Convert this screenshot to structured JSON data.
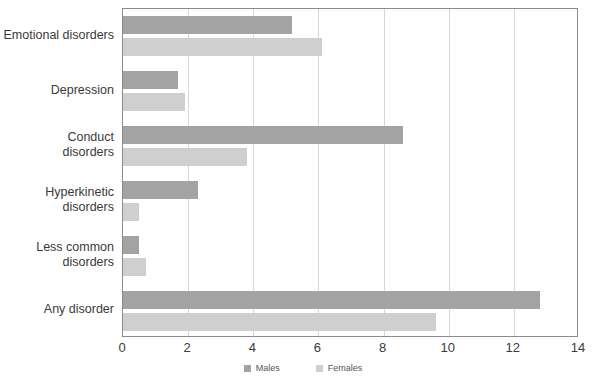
{
  "chart_data": {
    "type": "bar",
    "orientation": "horizontal",
    "title": "",
    "xlabel": "",
    "ylabel": "",
    "xlim": [
      0,
      14
    ],
    "xticks": [
      0,
      2,
      4,
      6,
      8,
      10,
      12,
      14
    ],
    "grid": true,
    "legend_position": "bottom",
    "categories": [
      "Emotional disorders",
      "Depression",
      "Conduct disorders",
      "Hyperkinetic disorders",
      "Less common disorders",
      "Any disorder"
    ],
    "series": [
      {
        "name": "Males",
        "color": "#a3a3a3",
        "values": [
          5.2,
          1.7,
          8.6,
          2.3,
          0.5,
          12.8
        ]
      },
      {
        "name": "Females",
        "color": "#cfcfcf",
        "values": [
          6.1,
          1.9,
          3.8,
          0.5,
          0.7,
          9.6
        ]
      }
    ]
  },
  "category_label_lines": [
    [
      "Emotional disorders"
    ],
    [
      "Depression"
    ],
    [
      "Conduct",
      "disorders"
    ],
    [
      "Hyperkinetic",
      "disorders"
    ],
    [
      "Less common",
      "disorders"
    ],
    [
      "Any disorder"
    ]
  ],
  "legend": {
    "items": [
      {
        "label": "Males",
        "color": "#a3a3a3"
      },
      {
        "label": "Females",
        "color": "#cfcfcf"
      }
    ]
  },
  "axis": {
    "tick_labels": [
      "0",
      "2",
      "4",
      "6",
      "8",
      "10",
      "12",
      "14"
    ]
  },
  "colors": {
    "males": "#a3a3a3",
    "females": "#cfcfcf",
    "frame": "#8c8c8c",
    "gridline": "#d6d6d6",
    "text": "#3a3a3a",
    "background": "#ffffff"
  }
}
